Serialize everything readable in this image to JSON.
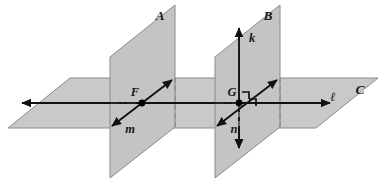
{
  "figure": {
    "background_color": "#ffffff",
    "plane_fill_color": "#c9c9c9",
    "plane_edge_color": "#8a8a8a",
    "line_color": "#111111",
    "hidden_edge_color": "#8f8f8f",
    "width": 385,
    "height": 184
  },
  "planes": [
    {
      "id": "plane-a",
      "label": "A",
      "label_x": 160,
      "label_y": 20,
      "orientation": "vertical",
      "points": "110,178 110,57 175,5 175,127"
    },
    {
      "id": "plane-b",
      "label": "B",
      "label_x": 268,
      "label_y": 20,
      "orientation": "vertical",
      "points": "215,178 215,57 280,5 280,127"
    },
    {
      "id": "plane-c",
      "label": "C",
      "label_x": 360,
      "label_y": 94,
      "orientation": "horizontal",
      "points": "8,128 70,78 378,78 316,128"
    }
  ],
  "lines": [
    {
      "id": "line-l",
      "label": "ℓ",
      "label_x": 333,
      "label_y": 101,
      "description": "horizontal line in plane C through F and G",
      "x1": 22,
      "y1": 103,
      "x2": 330,
      "y2": 103,
      "arrow_start": true,
      "arrow_end": true
    },
    {
      "id": "line-m",
      "label": "m",
      "label_x": 130,
      "label_y": 133,
      "description": "slanted line in plane C through F",
      "x1": 112,
      "y1": 126,
      "x2": 172,
      "y2": 80,
      "arrow_start": true,
      "arrow_end": true
    },
    {
      "id": "line-n",
      "label": "n",
      "label_x": 234,
      "label_y": 133,
      "description": "slanted line in plane C through G",
      "x1": 217,
      "y1": 126,
      "x2": 277,
      "y2": 80,
      "arrow_start": true,
      "arrow_end": true
    },
    {
      "id": "line-k",
      "label": "k",
      "label_x": 252,
      "label_y": 42,
      "description": "vertical line in plane B through G, perpendicular to plane C",
      "x1": 239,
      "y1": 28,
      "x2": 239,
      "y2": 148,
      "arrow_start": true,
      "arrow_end": true
    }
  ],
  "points": [
    {
      "id": "point-f",
      "label": "F",
      "x": 142,
      "y": 103,
      "label_x": 135,
      "label_y": 96
    },
    {
      "id": "point-g",
      "label": "G",
      "x": 239,
      "y": 103,
      "label_x": 232,
      "label_y": 96
    }
  ],
  "right_angle_marks": [
    {
      "id": "right-angle-upper",
      "path": "M 242,92 L 249,92 L 249,99"
    },
    {
      "id": "right-angle-lower",
      "path": "M 249,99 L 256,99 L 256,106"
    }
  ],
  "hidden_edges": {
    "plane_c_back_in_a": "M 110,78 L 175,78 L 175,127",
    "plane_c_back_in_b": "M 215,78 L 280,78 L 280,127",
    "line_k_hidden": "M 239,103 L 239,128",
    "line_l_hidden_a": "M 110,103 L 142,103",
    "line_l_hidden_b": "M 215,103 L 239,103"
  }
}
